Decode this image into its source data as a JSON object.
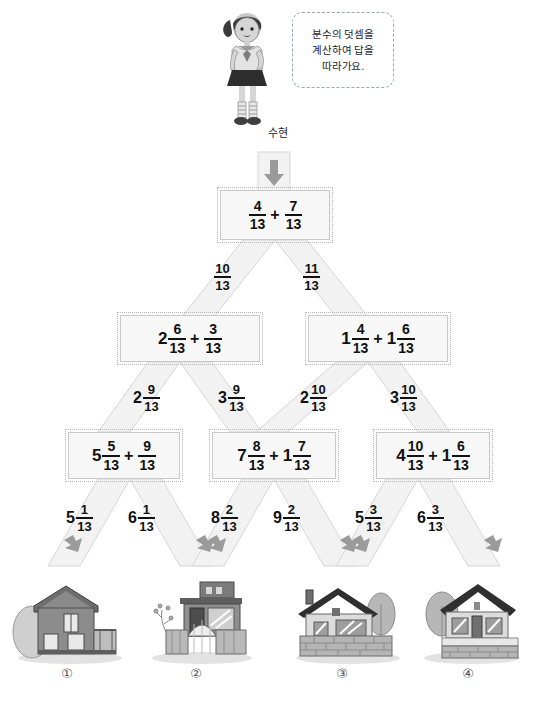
{
  "character": {
    "name_label": "수현",
    "bubble_lines": [
      "분수의 덧셈을",
      "계산하여 답을",
      "따라가요."
    ]
  },
  "tree": {
    "level1": {
      "box": {
        "terms": [
          {
            "whole": "",
            "num": "4",
            "den": "13"
          },
          {
            "whole": "",
            "num": "7",
            "den": "13"
          }
        ]
      },
      "branches": [
        {
          "whole": "",
          "num": "10",
          "den": "13"
        },
        {
          "whole": "",
          "num": "11",
          "den": "13"
        }
      ]
    },
    "level2": {
      "boxes": [
        {
          "terms": [
            {
              "whole": "2",
              "num": "6",
              "den": "13"
            },
            {
              "whole": "",
              "num": "3",
              "den": "13"
            }
          ]
        },
        {
          "terms": [
            {
              "whole": "1",
              "num": "4",
              "den": "13"
            },
            {
              "whole": "1",
              "num": "6",
              "den": "13"
            }
          ]
        }
      ],
      "branches": [
        {
          "whole": "2",
          "num": "9",
          "den": "13"
        },
        {
          "whole": "3",
          "num": "9",
          "den": "13"
        },
        {
          "whole": "2",
          "num": "10",
          "den": "13"
        },
        {
          "whole": "3",
          "num": "10",
          "den": "13"
        }
      ]
    },
    "level3": {
      "boxes": [
        {
          "terms": [
            {
              "whole": "5",
              "num": "5",
              "den": "13"
            },
            {
              "whole": "",
              "num": "9",
              "den": "13"
            }
          ]
        },
        {
          "terms": [
            {
              "whole": "7",
              "num": "8",
              "den": "13"
            },
            {
              "whole": "1",
              "num": "7",
              "den": "13"
            }
          ]
        },
        {
          "terms": [
            {
              "whole": "4",
              "num": "10",
              "den": "13"
            },
            {
              "whole": "1",
              "num": "6",
              "den": "13"
            }
          ]
        }
      ],
      "branches": [
        {
          "whole": "5",
          "num": "1",
          "den": "13"
        },
        {
          "whole": "6",
          "num": "1",
          "den": "13"
        },
        {
          "whole": "8",
          "num": "2",
          "den": "13"
        },
        {
          "whole": "9",
          "num": "2",
          "den": "13"
        },
        {
          "whole": "5",
          "num": "3",
          "den": "13"
        },
        {
          "whole": "6",
          "num": "3",
          "den": "13"
        }
      ]
    }
  },
  "answers": [
    {
      "number": "①",
      "icon": "house-two-story-icon"
    },
    {
      "number": "②",
      "icon": "house-modern-gate-icon"
    },
    {
      "number": "③",
      "icon": "house-brick-wall-icon"
    },
    {
      "number": "④",
      "icon": "house-dark-roof-icon"
    }
  ],
  "colors": {
    "band_fill": "#f2f2f2",
    "band_stroke": "#d6d6d6",
    "box_fill": "#f7f7f7",
    "box_stroke": "#c9c9c9",
    "arrow": "#9a9a9a",
    "text": "#111111"
  }
}
